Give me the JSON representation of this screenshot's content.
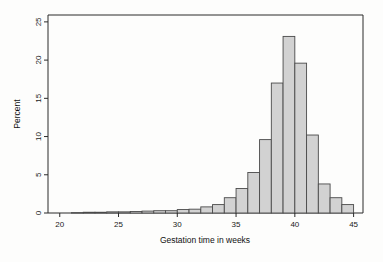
{
  "figure": {
    "title": "",
    "background_color": "#fdfdfc"
  },
  "chart_data": {
    "type": "bar",
    "title": "",
    "subtitle": "",
    "xlabel": "Gestation time in weeks",
    "ylabel": "Percent",
    "xlim": [
      19.0,
      45.8
    ],
    "ylim": [
      0,
      25.9
    ],
    "xticks": [
      20,
      25,
      30,
      35,
      40,
      45
    ],
    "xtick_labels": [
      "20",
      "25",
      "30",
      "35",
      "40",
      "45"
    ],
    "yticks": [
      0,
      5,
      10,
      15,
      20,
      25
    ],
    "ytick_labels": [
      "0",
      "5",
      "10",
      "15",
      "20",
      "25"
    ],
    "grid": false,
    "legend": false,
    "legend_position": "none",
    "bin_width": 1,
    "bar_fill_color": "#d2d2d2",
    "bar_edge_color": "#4a4a4a",
    "bins": [
      {
        "x0": 21,
        "x1": 22,
        "value": 0.05
      },
      {
        "x0": 22,
        "x1": 23,
        "value": 0.1
      },
      {
        "x0": 23,
        "x1": 24,
        "value": 0.1
      },
      {
        "x0": 24,
        "x1": 25,
        "value": 0.15
      },
      {
        "x0": 25,
        "x1": 26,
        "value": 0.15
      },
      {
        "x0": 26,
        "x1": 27,
        "value": 0.2
      },
      {
        "x0": 27,
        "x1": 28,
        "value": 0.25
      },
      {
        "x0": 28,
        "x1": 29,
        "value": 0.3
      },
      {
        "x0": 29,
        "x1": 30,
        "value": 0.3
      },
      {
        "x0": 30,
        "x1": 31,
        "value": 0.45
      },
      {
        "x0": 31,
        "x1": 32,
        "value": 0.5
      },
      {
        "x0": 32,
        "x1": 33,
        "value": 0.8
      },
      {
        "x0": 33,
        "x1": 34,
        "value": 1.1
      },
      {
        "x0": 34,
        "x1": 35,
        "value": 2.0
      },
      {
        "x0": 35,
        "x1": 36,
        "value": 3.2
      },
      {
        "x0": 36,
        "x1": 37,
        "value": 5.3
      },
      {
        "x0": 37,
        "x1": 38,
        "value": 9.6
      },
      {
        "x0": 38,
        "x1": 39,
        "value": 17.0
      },
      {
        "x0": 39,
        "x1": 40,
        "value": 23.1
      },
      {
        "x0": 40,
        "x1": 41,
        "value": 19.6
      },
      {
        "x0": 41,
        "x1": 42,
        "value": 10.2
      },
      {
        "x0": 42,
        "x1": 43,
        "value": 3.8
      },
      {
        "x0": 43,
        "x1": 44,
        "value": 2.0
      },
      {
        "x0": 44,
        "x1": 45,
        "value": 1.1
      }
    ],
    "categories": [
      "21",
      "22",
      "23",
      "24",
      "25",
      "26",
      "27",
      "28",
      "29",
      "30",
      "31",
      "32",
      "33",
      "34",
      "35",
      "36",
      "37",
      "38",
      "39",
      "40",
      "41",
      "42",
      "43",
      "44"
    ],
    "values": [
      0.05,
      0.1,
      0.1,
      0.15,
      0.15,
      0.2,
      0.25,
      0.3,
      0.3,
      0.45,
      0.5,
      0.8,
      1.1,
      2.0,
      3.2,
      5.3,
      9.6,
      17.0,
      23.1,
      19.6,
      10.2,
      3.8,
      2.0,
      1.1
    ]
  }
}
